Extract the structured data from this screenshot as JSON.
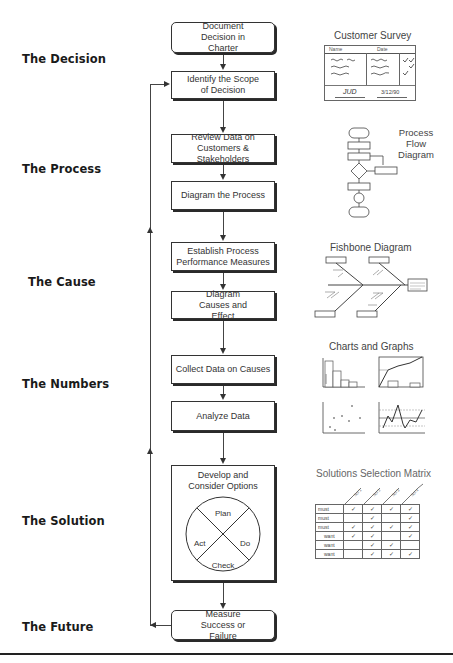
{
  "phases": [
    {
      "label": "The Decision"
    },
    {
      "label": "The Process"
    },
    {
      "label": "The Cause"
    },
    {
      "label": "The Numbers"
    },
    {
      "label": "The Solution"
    },
    {
      "label": "The Future"
    }
  ],
  "steps": [
    {
      "label": "Document Decision in Charter"
    },
    {
      "label": "Identify the Scope of Decision"
    },
    {
      "label": "Review Data on Customers & Stakeholders"
    },
    {
      "label": "Diagram the Process"
    },
    {
      "label": "Establish Process Performance Measures"
    },
    {
      "label": "Diagram Causes and Effect"
    },
    {
      "label": "Collect Data on Causes"
    },
    {
      "label": "Analyze Data"
    },
    {
      "label": "Develop and Consider Options"
    },
    {
      "label": "Measure Success or Failure"
    }
  ],
  "pdca": {
    "plan": "Plan",
    "do": "Do",
    "check": "Check",
    "act": "Act"
  },
  "illustrations": {
    "survey": {
      "title": "Customer Survey",
      "name_label": "Name",
      "date_label": "Date",
      "signature": "JUD",
      "date_value": "3/12/90"
    },
    "process_flow": {
      "title_line1": "Process",
      "title_line2": "Flow",
      "title_line3": "Diagram"
    },
    "fishbone": {
      "title": "Fishbone Diagram"
    },
    "charts": {
      "title": "Charts and Graphs"
    },
    "matrix": {
      "title": "Solutions Selection Matrix",
      "columns": [
        "Sol 1",
        "Sol 2",
        "Sol 3",
        "Sol 4"
      ],
      "rows": [
        {
          "label": "must",
          "checks": [
            true,
            true,
            true,
            true
          ]
        },
        {
          "label": "must",
          "checks": [
            false,
            true,
            false,
            true
          ]
        },
        {
          "label": "must",
          "checks": [
            true,
            true,
            true,
            true
          ]
        },
        {
          "label": "want",
          "checks": [
            true,
            true,
            false,
            true
          ]
        },
        {
          "label": "want",
          "checks": [
            false,
            true,
            true,
            false
          ]
        },
        {
          "label": "want",
          "checks": [
            false,
            true,
            true,
            true
          ]
        }
      ],
      "check_glyph": "✓"
    }
  }
}
